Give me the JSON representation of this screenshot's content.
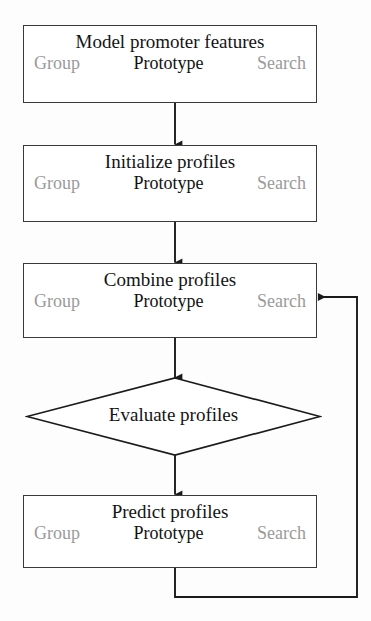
{
  "diagram": {
    "background_color": "#fdfdfd",
    "stroke_color": "#3a3a3a",
    "text_color": "#141414",
    "muted_text_color": "#9a9a9a"
  },
  "nodes": [
    {
      "id": "model-promoter-features",
      "shape": "process",
      "title": "Model promoter features",
      "tools": [
        {
          "label": "Group",
          "state": "muted"
        },
        {
          "label": "Prototype",
          "state": "active"
        },
        {
          "label": "Search",
          "state": "muted"
        }
      ]
    },
    {
      "id": "initialize-profiles",
      "shape": "process",
      "title": "Initialize profiles",
      "tools": [
        {
          "label": "Group",
          "state": "muted"
        },
        {
          "label": "Prototype",
          "state": "active"
        },
        {
          "label": "Search",
          "state": "muted"
        }
      ]
    },
    {
      "id": "combine-profiles",
      "shape": "process",
      "title": "Combine profiles",
      "tools": [
        {
          "label": "Group",
          "state": "muted"
        },
        {
          "label": "Prototype",
          "state": "active"
        },
        {
          "label": "Search",
          "state": "muted"
        }
      ]
    },
    {
      "id": "evaluate-profiles",
      "shape": "decision",
      "title": "Evaluate profiles",
      "tools": []
    },
    {
      "id": "predict-profiles",
      "shape": "process",
      "title": "Predict profiles",
      "tools": [
        {
          "label": "Group",
          "state": "muted"
        },
        {
          "label": "Prototype",
          "state": "active"
        },
        {
          "label": "Search",
          "state": "muted"
        }
      ]
    }
  ],
  "edges": [
    {
      "id": "edge-model-to-initialize",
      "from": "model-promoter-features",
      "to": "initialize-profiles",
      "kind": "straight-down"
    },
    {
      "id": "edge-initialize-to-combine",
      "from": "initialize-profiles",
      "to": "combine-profiles",
      "kind": "straight-down"
    },
    {
      "id": "edge-combine-to-evaluate",
      "from": "combine-profiles",
      "to": "evaluate-profiles",
      "kind": "straight-down"
    },
    {
      "id": "edge-evaluate-to-predict",
      "from": "evaluate-profiles",
      "to": "predict-profiles",
      "kind": "straight-down"
    },
    {
      "id": "edge-predict-to-combine",
      "from": "predict-profiles",
      "to": "combine-profiles",
      "kind": "feedback-loop-right"
    }
  ]
}
